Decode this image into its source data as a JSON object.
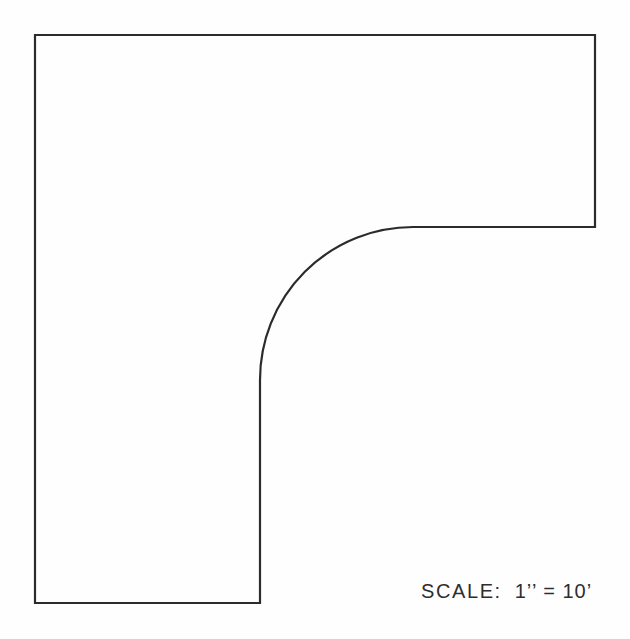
{
  "document": {
    "background_color": "#fefefe",
    "line_color": "#2b2b2b",
    "text_color": "#2e2e2e"
  },
  "drawing": {
    "outline_path": "M 35 35 H 595 V 227 H 413 A 153 153 0 0 0 260 380 V 603 H 35 Z"
  },
  "scale_note": {
    "label": "SCALE:",
    "value": "1’’ = 10’"
  }
}
